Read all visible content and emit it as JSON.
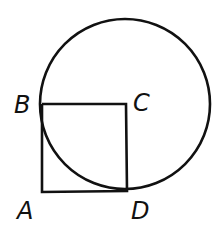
{
  "diagram": {
    "stroke_color": "#111111",
    "background": "#ffffff",
    "points": {
      "A": {
        "label": "A",
        "x": 42,
        "y": 191
      },
      "B": {
        "label": "B",
        "x": 42,
        "y": 104
      },
      "C": {
        "label": "C",
        "x": 126,
        "y": 104
      },
      "D": {
        "label": "D",
        "x": 127,
        "y": 190
      }
    },
    "circle": {
      "center": "C",
      "cx": 125,
      "cy": 104,
      "r": 85
    },
    "segments": [
      [
        "B",
        "C"
      ],
      [
        "C",
        "D"
      ],
      [
        "D",
        "A"
      ],
      [
        "A",
        "B"
      ]
    ]
  }
}
